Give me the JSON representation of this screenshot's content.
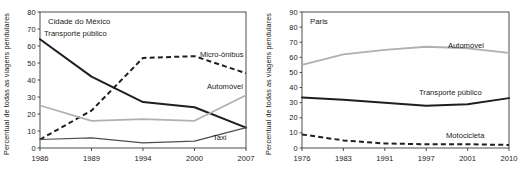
{
  "figure": {
    "shared_ylabel": "Percentual de todas as viagens pendulares"
  },
  "chart_data": [
    {
      "type": "line",
      "title": "Cidade do México",
      "xlabel": "",
      "ylabel": "Percentual de todas as viagens pendulares",
      "categories": [
        "1986",
        "1989",
        "1994",
        "2000",
        "2007"
      ],
      "x": [
        1986,
        1989,
        1994,
        2000,
        2007
      ],
      "ylim": [
        0,
        80
      ],
      "yticks": [
        0,
        10,
        20,
        30,
        40,
        50,
        60,
        70,
        80
      ],
      "ytick_labels": [
        "0",
        "10",
        "20",
        "30",
        "40",
        "50",
        "60",
        "70",
        "80"
      ],
      "grid": false,
      "legend": "inline-annotations",
      "series": [
        {
          "name": "Transporte público",
          "style": "solid",
          "color": "#1f1f1f",
          "values": [
            64,
            42,
            27,
            24,
            12
          ],
          "label_anchor": "left-top"
        },
        {
          "name": "Micro-ônibus",
          "style": "dashed",
          "color": "#1f1f1f",
          "values": [
            5,
            22,
            53,
            54,
            44
          ],
          "label_anchor": "right"
        },
        {
          "name": "Automóvel",
          "style": "solid-light",
          "color": "#b0b0b0",
          "values": [
            25,
            16,
            17,
            16,
            31
          ],
          "label_anchor": "right"
        },
        {
          "name": "Taxi",
          "style": "solid-thin",
          "color": "#4d4d4d",
          "values": [
            5,
            6,
            3,
            4,
            12
          ],
          "label_anchor": "right-bottom"
        }
      ]
    },
    {
      "type": "line",
      "title": "Paris",
      "xlabel": "",
      "ylabel": "Percentual de todas as viagens pendulares",
      "categories": [
        "1976",
        "1983",
        "1991",
        "1997",
        "2001",
        "2010"
      ],
      "x": [
        1976,
        1983,
        1991,
        1997,
        2001,
        2010
      ],
      "ylim": [
        0,
        90
      ],
      "yticks": [
        0,
        10,
        20,
        30,
        40,
        50,
        60,
        70,
        80,
        90
      ],
      "ytick_labels": [
        "0",
        "10",
        "20",
        "30",
        "40",
        "50",
        "60",
        "70",
        "80",
        "90"
      ],
      "grid": false,
      "legend": "inline-annotations",
      "series": [
        {
          "name": "Automóvel",
          "style": "solid-light",
          "color": "#b0b0b0",
          "values": [
            55,
            62,
            65,
            67,
            66,
            63
          ],
          "label_anchor": "right"
        },
        {
          "name": "Transporte público",
          "style": "solid",
          "color": "#1f1f1f",
          "values": [
            33.5,
            32,
            30,
            28,
            29,
            33
          ],
          "label_anchor": "right"
        },
        {
          "name": "Motocicleta",
          "style": "dashed",
          "color": "#1f1f1f",
          "values": [
            9,
            5,
            3,
            2.5,
            2.5,
            2
          ],
          "label_anchor": "right"
        }
      ]
    }
  ]
}
